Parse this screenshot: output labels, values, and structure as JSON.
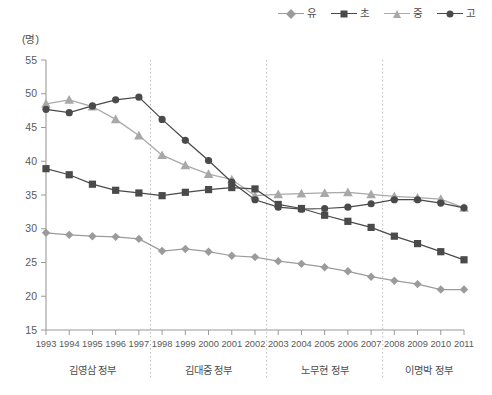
{
  "unit_label": "(명)",
  "legend": {
    "position": "top-right",
    "items": [
      {
        "label": "유",
        "marker": "diamond-icon",
        "color": "#9b9b9b"
      },
      {
        "label": "초",
        "marker": "square-icon",
        "color": "#4a4a4a"
      },
      {
        "label": "중",
        "marker": "triangle-icon",
        "color": "#a8a8a8"
      },
      {
        "label": "고",
        "marker": "circle-icon",
        "color": "#4a4a4a"
      }
    ]
  },
  "governments": [
    {
      "label": "김영삼 정부",
      "start": 1993,
      "end": 1997
    },
    {
      "label": "김대중 정부",
      "start": 1998,
      "end": 2002
    },
    {
      "label": "노무현 정부",
      "start": 2003,
      "end": 2007
    },
    {
      "label": "이명박 정부",
      "start": 2008,
      "end": 2011
    }
  ],
  "chart_data": {
    "type": "line",
    "title": "",
    "xlabel": "",
    "ylabel": "(명)",
    "ylim": [
      15,
      55
    ],
    "yticks": [
      15,
      20,
      25,
      30,
      35,
      40,
      45,
      50,
      55
    ],
    "grid": false,
    "legend_position": "top-right",
    "x": [
      1993,
      1994,
      1995,
      1996,
      1997,
      1998,
      1999,
      2000,
      2001,
      2002,
      2003,
      2004,
      2005,
      2006,
      2007,
      2008,
      2009,
      2010,
      2011
    ],
    "xticklabels": [
      "1993",
      "1994",
      "1995",
      "1996",
      "1997",
      "1998",
      "1999",
      "2000",
      "2001",
      "2002",
      "2003",
      "2004",
      "2005",
      "2006",
      "2007",
      "2008",
      "2009",
      "2010",
      "2011"
    ],
    "series": [
      {
        "name": "유",
        "marker": "diamond",
        "color": "#9b9b9b",
        "values": [
          29.4,
          29.1,
          28.9,
          28.8,
          28.5,
          26.7,
          27.0,
          26.6,
          26.0,
          25.8,
          25.2,
          24.8,
          24.3,
          23.7,
          22.9,
          22.3,
          21.8,
          21.0,
          21.0
        ]
      },
      {
        "name": "초",
        "marker": "square",
        "color": "#4a4a4a",
        "values": [
          38.9,
          38.0,
          36.6,
          35.7,
          35.3,
          34.9,
          35.4,
          35.8,
          36.1,
          35.9,
          33.6,
          33.0,
          32.0,
          31.1,
          30.2,
          28.9,
          27.8,
          26.6,
          25.4
        ]
      },
      {
        "name": "중",
        "marker": "triangle",
        "color": "#a8a8a8",
        "values": [
          48.5,
          49.1,
          48.1,
          46.2,
          43.8,
          40.9,
          39.4,
          38.1,
          37.3,
          34.9,
          35.1,
          35.2,
          35.3,
          35.4,
          35.1,
          34.8,
          34.6,
          34.4,
          33.1
        ]
      },
      {
        "name": "고",
        "marker": "circle",
        "color": "#4a4a4a",
        "values": [
          47.7,
          47.2,
          48.2,
          49.1,
          49.5,
          46.2,
          43.1,
          40.1,
          36.9,
          34.3,
          33.2,
          32.9,
          33.0,
          33.2,
          33.7,
          34.3,
          34.3,
          33.8,
          33.1
        ]
      }
    ]
  }
}
